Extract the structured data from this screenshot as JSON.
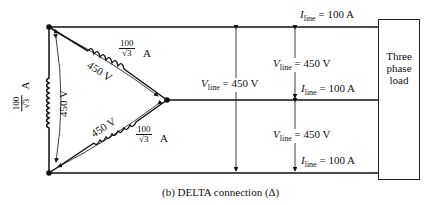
{
  "caption": "(b) DELTA connection (Δ)",
  "load": {
    "label": "Three phase load"
  },
  "delta": {
    "phase_voltage": "450 V",
    "phase_current_num": "100",
    "phase_current_den": "√3",
    "phase_current_unit": "A"
  },
  "line_values": {
    "v_symbol": "V",
    "v_sub": "line",
    "v_value": "= 450 V",
    "i_symbol": "I",
    "i_sub": "line",
    "i_value": "= 100 A"
  }
}
